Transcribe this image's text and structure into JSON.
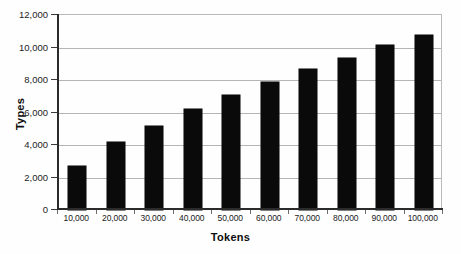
{
  "chart_data": {
    "type": "bar",
    "title": "",
    "subtitle": "",
    "xlabel": "Tokens",
    "ylabel": "Types",
    "categories": [
      "10,000",
      "20,000",
      "30,000",
      "40,000",
      "50,000",
      "60,000",
      "70,000",
      "80,000",
      "90,000",
      "100,000"
    ],
    "values": [
      2700,
      4200,
      5200,
      6200,
      7100,
      7900,
      8650,
      9350,
      10150,
      10750
    ],
    "series": [
      {
        "name": "Types",
        "values": [
          2700,
          4200,
          5200,
          6200,
          7100,
          7900,
          8650,
          9350,
          10150,
          10750
        ]
      }
    ],
    "ylim": [
      0,
      12000
    ],
    "ytick_values": [
      0,
      2000,
      4000,
      6000,
      8000,
      10000,
      12000
    ],
    "ytick_labels": [
      "0",
      "2,000",
      "4,000",
      "6,000",
      "8,000",
      "10,000",
      "12,000"
    ],
    "grid": true,
    "grid_axis": "y",
    "legend": false,
    "legend_position": "none",
    "bar_color": "#0a0a0a",
    "grid_color": "#b5b5b5",
    "axis_color": "#2b2b2b",
    "background_color": "#fefefe"
  }
}
